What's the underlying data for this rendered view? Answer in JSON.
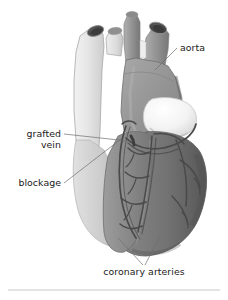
{
  "figure": {
    "kind": "anatomical-illustration",
    "background_color": "#ffffff",
    "labels": [
      {
        "id": "aorta",
        "text": "aorta",
        "lines": [
          "aorta"
        ],
        "anchor": "start",
        "x": 180,
        "y": 51,
        "leader": "M 177 48 L 155 70"
      },
      {
        "id": "grafted-vein",
        "text": "grafted vein",
        "lines": [
          "grafted",
          "vein"
        ],
        "anchor": "end",
        "x": 61,
        "y": 137,
        "line_height": 11,
        "leader": "M 64 134 L 128 141"
      },
      {
        "id": "blockage",
        "text": "blockage",
        "lines": [
          "blockage"
        ],
        "anchor": "end",
        "x": 61,
        "y": 186,
        "leader": "M 64 183 L 121 139"
      },
      {
        "id": "coronary-arteries",
        "text": "coronary arteries",
        "lines": [
          "coronary arteries"
        ],
        "anchor": "middle",
        "x": 144,
        "y": 275,
        "leader": "M 118 238 L 143 265 M 160 236 L 145 265"
      }
    ],
    "separator_rule": {
      "x1": 8,
      "y1": 290,
      "x2": 220,
      "y2": 290,
      "color": "#c8c8c8"
    },
    "palette": {
      "vessel_pale": "#e3e3e3",
      "vessel_pale_shadow": "#cfcfcf",
      "aorta_mid": "#9a9a9a",
      "aorta_shadow": "#7d7d7d",
      "ventricle_light": "#a0a0a0",
      "ventricle_mid": "#888888",
      "ventricle_dark": "#6b6b6b",
      "ventricle_darkest": "#5a5a5a",
      "pulmonary_highlight": "#f4f4f4",
      "lumen_dark": "#3f3f3f",
      "lumen_rim": "#6a6a6a",
      "artery_line": "#4a4a4a",
      "outline": "#787878",
      "label_color": "#1a1a1a",
      "leader_color": "#6e6e6e"
    },
    "structures": [
      {
        "id": "superior-vena-cava",
        "tone": "vessel_pale"
      },
      {
        "id": "brachiocephalic-trunk",
        "tone": "vessel_pale"
      },
      {
        "id": "left-common-carotid",
        "tone": "aorta_mid"
      },
      {
        "id": "left-subclavian",
        "tone": "aorta_mid"
      },
      {
        "id": "aortic-arch",
        "tone": "aorta_mid"
      },
      {
        "id": "ascending-aorta",
        "tone": "aorta_shadow"
      },
      {
        "id": "pulmonary-trunk",
        "tone": "pulmonary_highlight"
      },
      {
        "id": "right-ventricle",
        "tone": "ventricle_mid"
      },
      {
        "id": "left-ventricle",
        "tone": "ventricle_dark"
      },
      {
        "id": "right-atrium",
        "tone": "vessel_pale_shadow"
      },
      {
        "id": "coronary-artery-tree",
        "tone": "artery_line"
      },
      {
        "id": "grafted-vein-conduit",
        "tone": "artery_line"
      },
      {
        "id": "blockage-site",
        "tone": "artery_line"
      }
    ]
  }
}
